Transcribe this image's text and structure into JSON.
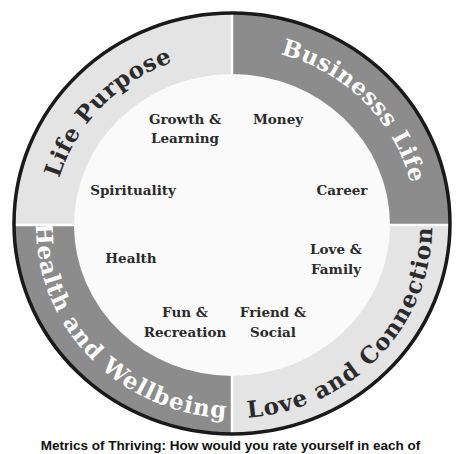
{
  "diagram": {
    "type": "wheel-of-life",
    "colors": {
      "light_segment": "#e4e4e4",
      "dark_segment": "#8c8c8c",
      "inner_circle": "#fafafa",
      "outline": "#1a1a1a",
      "dark_text": "#2b2b2b",
      "light_text": "#ffffff"
    },
    "quadrants": [
      {
        "label": "Life Purpose",
        "position": "top-left",
        "shade": "light",
        "items": [
          "Growth & Learning",
          "Spirituality"
        ]
      },
      {
        "label": "Businesss Life",
        "position": "top-right",
        "shade": "dark",
        "items": [
          "Money",
          "Career"
        ]
      },
      {
        "label": "Love and Connection",
        "position": "bottom-right",
        "shade": "light",
        "items": [
          "Love & Family",
          "Friend & Social"
        ]
      },
      {
        "label": "Health and Wellbeing",
        "position": "bottom-left",
        "shade": "dark",
        "items": [
          "Health",
          "Fun & Recreation"
        ]
      }
    ],
    "inner_labels": {
      "growth_1": "Growth &",
      "growth_2": "Learning",
      "money": "Money",
      "spirituality": "Spirituality",
      "career": "Career",
      "health": "Health",
      "love_1": "Love &",
      "love_2": "Family",
      "fun_1": "Fun &",
      "fun_2": "Recreation",
      "friend_1": "Friend &",
      "friend_2": "Social"
    }
  },
  "caption": "Metrics of Thriving: How would you rate yourself in each of"
}
